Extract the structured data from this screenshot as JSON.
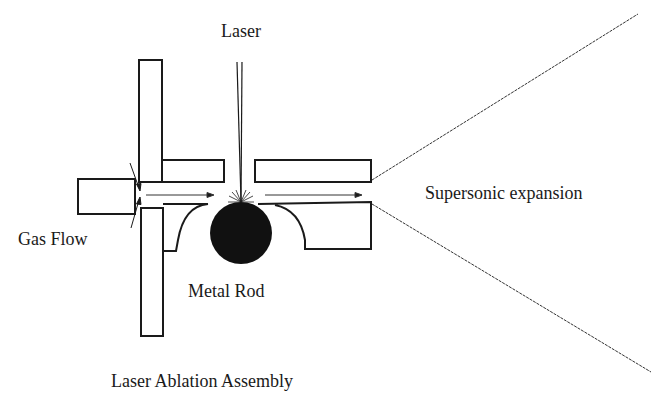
{
  "title": "Laser Ablation Assembly",
  "labels": {
    "laser": "Laser",
    "gas_flow": "Gas Flow",
    "metal_rod": "Metal Rod",
    "supersonic_expansion": "Supersonic expansion",
    "caption": "Laser Ablation Assembly"
  },
  "colors": {
    "line": "#1a1a1a",
    "rod_fill": "#111111",
    "background": "#ffffff"
  }
}
